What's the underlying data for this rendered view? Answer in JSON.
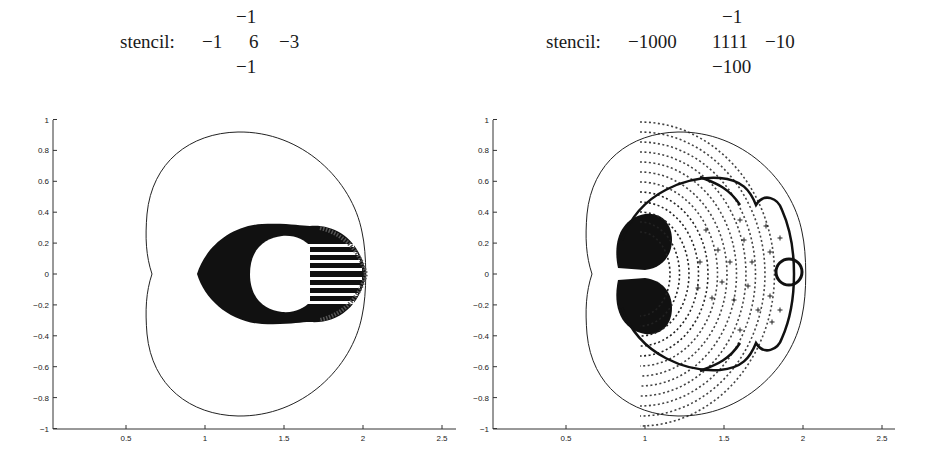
{
  "panels": [
    {
      "stencil": {
        "label": "stencil:",
        "top": "−1",
        "left": "−1",
        "center": "6",
        "right": "−3",
        "bottom": "−1"
      }
    },
    {
      "stencil": {
        "label": "stencil:",
        "top": "−1",
        "left": "−1000",
        "center": "1111",
        "right": "−10",
        "bottom": "−100"
      }
    }
  ],
  "chart_data": [
    {
      "type": "scatter",
      "title": "stencil: [top -1; -1 6 -3; bottom -1]",
      "xlabel": "",
      "ylabel": "",
      "xlim": [
        0.03,
        2.6
      ],
      "ylim": [
        -1,
        1
      ],
      "x_ticks": [
        "0.5",
        "1",
        "1.5",
        "2",
        "2.5"
      ],
      "y_ticks": [
        "1",
        "0.8",
        "0.6",
        "0.4",
        "0.2",
        "0",
        "-0.2",
        "-0.4",
        "-0.6",
        "-0.8",
        "-1"
      ],
      "grid": false,
      "series": [
        {
          "name": "stability boundary (kidney curve)",
          "kind": "line",
          "extent_x": [
            0.66,
            2.02
          ],
          "extent_y": [
            -0.92,
            0.92
          ]
        },
        {
          "name": "eigenvalues (+ markers)",
          "kind": "scatter",
          "extent_x": [
            0.98,
            2.02
          ],
          "extent_y": [
            -0.31,
            0.31
          ],
          "note": "dense filled blob with central hole ~x 1.3-1.6"
        }
      ]
    },
    {
      "type": "scatter",
      "title": "stencil: [top -1; -1000 1111 -10; bottom -100]",
      "xlabel": "",
      "ylabel": "",
      "xlim": [
        0.03,
        2.6
      ],
      "ylim": [
        -1,
        1
      ],
      "x_ticks": [
        "0.5",
        "1",
        "1.5",
        "2",
        "2.5"
      ],
      "y_ticks": [
        "1",
        "0.8",
        "0.6",
        "0.4",
        "0.2",
        "0",
        "-0.2",
        "-0.4",
        "-0.6",
        "-0.8",
        "-1"
      ],
      "grid": false,
      "series": [
        {
          "name": "stability boundary (kidney curve)",
          "kind": "line",
          "extent_x": [
            0.66,
            2.02
          ],
          "extent_y": [
            -0.92,
            0.92
          ]
        },
        {
          "name": "eigenvalues (+ markers)",
          "kind": "scatter",
          "extent_x": [
            0.98,
            1.98
          ],
          "extent_y": [
            -0.67,
            0.67
          ],
          "note": "concentric arcs, dense near x=1"
        },
        {
          "name": "isolated eigenvalue circle",
          "kind": "marker",
          "x": 1.92,
          "y": 0.01,
          "radius": 0.09
        }
      ]
    }
  ]
}
